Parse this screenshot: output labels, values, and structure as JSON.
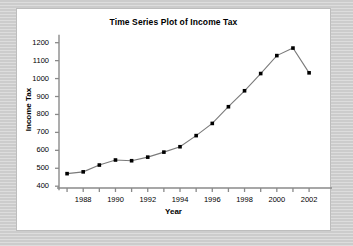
{
  "chart_data": {
    "type": "line",
    "title": "Time Series Plot of Income Tax",
    "xlabel": "Year",
    "ylabel": "Income Tax",
    "x": [
      1987,
      1988,
      1989,
      1990,
      1991,
      1992,
      1993,
      1994,
      1995,
      1996,
      1997,
      1998,
      1999,
      2000,
      2001,
      2002
    ],
    "values": [
      470,
      480,
      518,
      546,
      542,
      562,
      590,
      620,
      682,
      750,
      843,
      932,
      1028,
      1128,
      1170,
      1032
    ],
    "series": [
      {
        "name": "Income Tax",
        "values": [
          470,
          480,
          518,
          546,
          542,
          562,
          590,
          620,
          682,
          750,
          843,
          932,
          1028,
          1128,
          1170,
          1032
        ]
      }
    ],
    "xlim": [
      1986.5,
      2002.8
    ],
    "ylim": [
      390,
      1215
    ],
    "ytick_labels": [
      "400",
      "500",
      "600",
      "700",
      "800",
      "900",
      "1000",
      "1100",
      "1200"
    ],
    "ytick_values": [
      400,
      500,
      600,
      700,
      800,
      900,
      1000,
      1100,
      1200
    ],
    "xtick_labels": [
      "1988",
      "1990",
      "1992",
      "1994",
      "1996",
      "1998",
      "2000",
      "2002"
    ],
    "xtick_values": [
      1988,
      1990,
      1992,
      1994,
      1996,
      1998,
      2000,
      2002
    ],
    "xminor_values": [
      1987,
      1989,
      1991,
      1993,
      1995,
      1997,
      1999,
      2001
    ],
    "grid": false,
    "legend": "none",
    "line_color": "#7a7a7a",
    "marker_color": "#000000",
    "marker_shape": "square",
    "axis_color": "#8a8a8a",
    "background_color": "#ffffff",
    "page_background_color": "#d3d3d3"
  }
}
